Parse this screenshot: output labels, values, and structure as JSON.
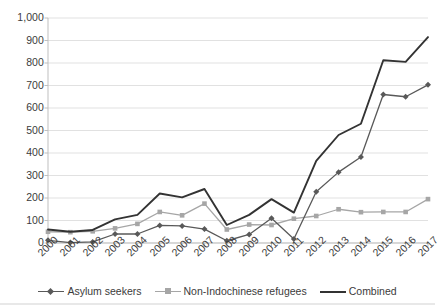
{
  "chart_data": {
    "type": "line",
    "title": "",
    "subtitle": "",
    "xlabel": "",
    "ylabel": "",
    "categories": [
      "2000",
      "2001",
      "2002",
      "2003",
      "2004",
      "2005",
      "2006",
      "2007",
      "2008",
      "2009",
      "2010",
      "2011",
      "2012",
      "2013",
      "2014",
      "2015",
      "2016",
      "2017"
    ],
    "series": [
      {
        "name": "Asylum seekers",
        "color": "#595959",
        "marker": "diamond",
        "values": [
          12,
          2,
          5,
          40,
          40,
          78,
          76,
          62,
          10,
          38,
          110,
          18,
          228,
          315,
          382,
          660,
          650,
          703
        ]
      },
      {
        "name": "Non-Indochinese refugees",
        "color": "#a6a6a6",
        "marker": "square",
        "values": [
          50,
          48,
          52,
          65,
          85,
          138,
          123,
          175,
          60,
          82,
          80,
          108,
          120,
          150,
          137,
          138,
          138,
          195
        ]
      },
      {
        "name": "Combined",
        "color": "#333333",
        "marker": "none",
        "values": [
          60,
          50,
          58,
          105,
          125,
          220,
          203,
          240,
          80,
          125,
          195,
          135,
          365,
          480,
          530,
          812,
          805,
          915
        ]
      }
    ],
    "ylim": [
      0,
      1000
    ],
    "ytick_values": [
      0,
      100,
      200,
      300,
      400,
      500,
      600,
      700,
      800,
      900,
      1000
    ],
    "ytick_labels": [
      "0",
      "100",
      "200",
      "300",
      "400",
      "500",
      "600",
      "700",
      "800",
      "900",
      "1,000"
    ],
    "grid": true,
    "grid_axis": "y",
    "grid_color": "#d9d9d9",
    "axis_color": "#bfbfbf",
    "legend_position": "bottom",
    "legend": [
      "Asylum seekers",
      "Non-Indochinese refugees",
      "Combined"
    ],
    "annotations": []
  },
  "legend_items": [
    {
      "label": "Asylum seekers",
      "color": "#595959",
      "marker": "diamond"
    },
    {
      "label": "Non-Indochinese refugees",
      "color": "#a6a6a6",
      "marker": "square"
    },
    {
      "label": "Combined",
      "color": "#333333",
      "marker": "none"
    }
  ]
}
